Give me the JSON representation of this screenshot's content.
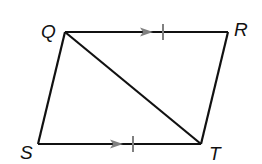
{
  "diagram": {
    "vertices": [
      {
        "label": "Q",
        "x": 65,
        "y": 32
      },
      {
        "label": "R",
        "x": 228,
        "y": 32
      },
      {
        "label": "T",
        "x": 201,
        "y": 144
      },
      {
        "label": "S",
        "x": 38,
        "y": 144
      }
    ],
    "segments": [
      {
        "from": "Q",
        "to": "R",
        "marks": [
          "parallel-arrow",
          "congruence-tick"
        ]
      },
      {
        "from": "R",
        "to": "T",
        "marks": []
      },
      {
        "from": "T",
        "to": "S",
        "marks": []
      },
      {
        "from": "S",
        "to": "Q",
        "marks": []
      },
      {
        "from": "S",
        "to": "T",
        "marks": [
          "parallel-arrow",
          "congruence-tick"
        ]
      },
      {
        "from": "Q",
        "to": "T",
        "marks": [],
        "type": "diagonal"
      }
    ],
    "labels": {
      "q": "Q",
      "r": "R",
      "s": "S",
      "t": "T"
    },
    "colors": {
      "line": "#111111",
      "mark": "#808080"
    }
  }
}
